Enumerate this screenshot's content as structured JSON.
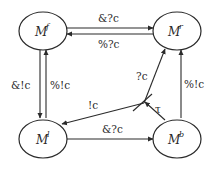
{
  "diagram": {
    "type": "state-transition",
    "nodes": [
      {
        "id": "f",
        "base": "M",
        "sup": "f"
      },
      {
        "id": "r",
        "base": "M",
        "sup": "r"
      },
      {
        "id": "l",
        "base": "M",
        "sup": "l"
      },
      {
        "id": "b",
        "base": "M",
        "sup": "b"
      }
    ],
    "edges": [
      {
        "from": "f",
        "to": "r",
        "label": "&?c"
      },
      {
        "from": "r",
        "to": "f",
        "label": "%?c"
      },
      {
        "from": "f",
        "to": "l",
        "label": "&!c"
      },
      {
        "from": "l",
        "to": "f",
        "label": "%!c"
      },
      {
        "from": "l",
        "to": "b",
        "label": "&?c"
      },
      {
        "from": "b",
        "to": "r",
        "label": "%!c"
      },
      {
        "from": "junction",
        "to": "l",
        "label": "!c"
      },
      {
        "from": "junction",
        "to": "r",
        "label": "?c"
      },
      {
        "from": "b",
        "to": "junction",
        "label": "τ"
      }
    ]
  }
}
